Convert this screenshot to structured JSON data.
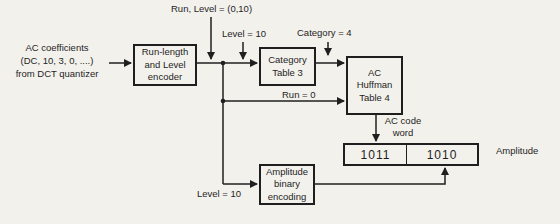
{
  "figure": {
    "type": "block-diagram",
    "background_color": "#f3f1ec",
    "ink_color": "#1f1f1f"
  },
  "labels": {
    "input_line1": "AC coefficients",
    "input_line2": "(DC, 10, 3, 0, ....)",
    "input_line3": "from DCT quantizer",
    "run_level": "Run, Level = (0,10)",
    "level_top": "Level = 10",
    "category_value": "Category = 4",
    "run_zero": "Run = 0",
    "level_bottom": "Level = 10",
    "ac_code_line1": "AC code",
    "ac_code_line2": "word",
    "amplitude": "Amplitude"
  },
  "boxes": {
    "rle": {
      "line1": "Run-length",
      "line2": "and Level",
      "line3": "encoder"
    },
    "category_table": {
      "line1": "Category",
      "line2": "Table 3"
    },
    "huffman": {
      "line1": "AC",
      "line2": "Huffman",
      "line3": "Table 4"
    },
    "amplitude_encoding": {
      "line1": "Amplitude",
      "line2": "binary",
      "line3": "encoding"
    },
    "codeword": {
      "cell1": "1011",
      "cell2": "1010"
    }
  }
}
